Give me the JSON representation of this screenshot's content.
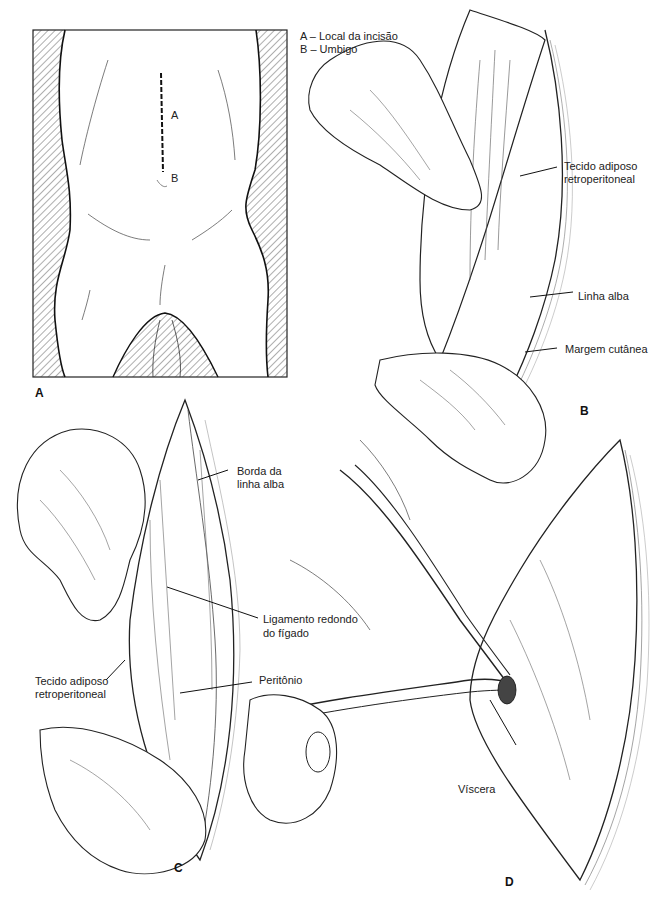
{
  "figure": {
    "panels": [
      {
        "id": "A",
        "legend": [
          "A – Local da incisão",
          "B – Umbigo"
        ],
        "markers": [
          "A",
          "B"
        ]
      },
      {
        "id": "B",
        "labels": [
          "Tecido adiposo retroperitoneal",
          "Linha alba",
          "Margem cutânea"
        ]
      },
      {
        "id": "C",
        "labels": [
          "Borda da linha alba",
          "Ligamento redondo do fígado",
          "Tecido adiposo retroperitoneal",
          "Peritônio"
        ]
      },
      {
        "id": "D",
        "labels": [
          "Víscera"
        ]
      }
    ],
    "text": {
      "legend_a": "A – Local da incisão",
      "legend_b": "B – Umbigo",
      "marker_a": "A",
      "marker_b": "B",
      "panel_a": "A",
      "panel_b": "B",
      "panel_c": "C",
      "panel_d": "D",
      "b_tecido_1": "Tecido adiposo",
      "b_tecido_2": "retroperitoneal",
      "b_linha_alba": "Linha alba",
      "b_margem": "Margem cutânea",
      "c_borda_1": "Borda da",
      "c_borda_2": "linha alba",
      "c_ligamento_1": "Ligamento redondo",
      "c_ligamento_2": "do fígado",
      "c_tecido_1": "Tecido adiposo",
      "c_tecido_2": "retroperitoneal",
      "c_peritonio": "Peritônio",
      "d_viscera": "Víscera"
    }
  }
}
